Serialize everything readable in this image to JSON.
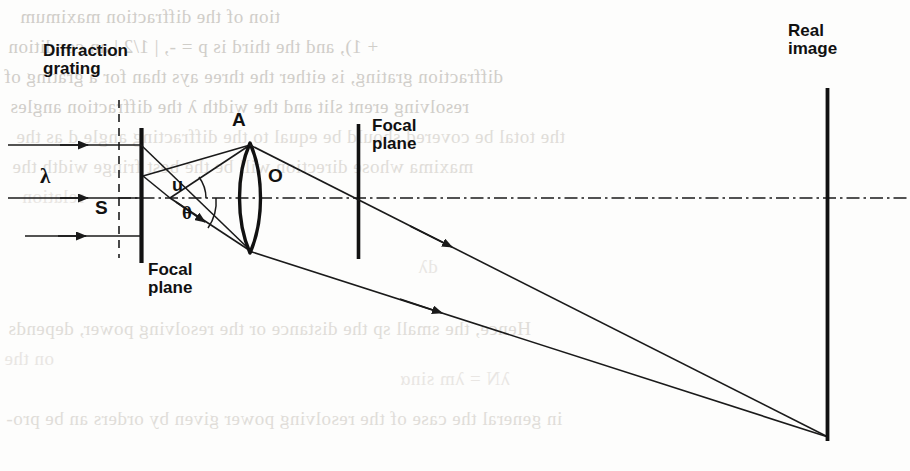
{
  "page": {
    "width": 910,
    "height": 471,
    "background_color": "#fdfdfc",
    "ink_color": "#111111",
    "ghost_color": "#c9c6c1"
  },
  "figure": {
    "kind": "optical-ray-diagram"
  },
  "labels": {
    "diffraction_grating": "Diffraction\ngrating",
    "focal_plane_left": "Focal\nplane",
    "focal_plane_right": "Focal\nplane",
    "real_image": "Real\nimage",
    "lens_top_point": "A",
    "lens_center_point": "O",
    "source_point": "S",
    "wavelength": "λ",
    "angle_u": "u",
    "angle_theta": "θ"
  },
  "elements": {
    "grating_line": {
      "x": 141,
      "y1": 128,
      "y2": 263
    },
    "grating_focal_plane_dashed": {
      "x": 119,
      "y1": 100,
      "y2": 258
    },
    "focal_plane_line_right": {
      "x": 358,
      "y1": 124,
      "y2": 259
    },
    "real_image_line": {
      "x": 827,
      "y1": 88,
      "y2": 441
    },
    "optical_axis": {
      "y": 198,
      "x1": 118,
      "x2": 910
    },
    "lens": {
      "cx": 250,
      "top": 143,
      "bottom": 253,
      "bulge": 13
    },
    "source": {
      "x": 170,
      "y": 198
    },
    "point_a": {
      "x": 250,
      "y": 145
    },
    "image_point": {
      "x": 828,
      "y": 437
    }
  },
  "incoming_rays": [
    {
      "y": 145,
      "x1": 8,
      "x2": 141,
      "arrow_at": 86
    },
    {
      "y": 198,
      "x1": 8,
      "x2": 141,
      "arrow_at": 86
    },
    {
      "y": 236,
      "x1": 25,
      "x2": 141,
      "arrow_at": 86
    }
  ],
  "outgoing_rays": [
    {
      "from_x": 250,
      "from_y": 145,
      "to_x": 828,
      "to_y": 437,
      "arrow_at_x": 452
    },
    {
      "from_x": 250,
      "from_y": 252,
      "to_x": 828,
      "to_y": 437,
      "arrow_at_x": 440
    }
  ],
  "ghost_text": [
    "tion of the diffraction maximum",
    "+ 1), and the third is p = -, | 1/2 | an  condition",
    "diffraction grating, is either the three  ays than for a grating of",
    "resolving     erent slit   and the width  λ the diffraction angles",
    "the total be covered should be equal to the diffracting angle d as the",
    "maxima whose direction will be  the best   fringe  width the",
    "relation",
    "Hence, the small sp  the distance or the resolving power, depends",
    "on the",
    "dλ",
    "λN = λm  sinα",
    "in general the case of the resolving power given by orders  an  be pro-"
  ]
}
